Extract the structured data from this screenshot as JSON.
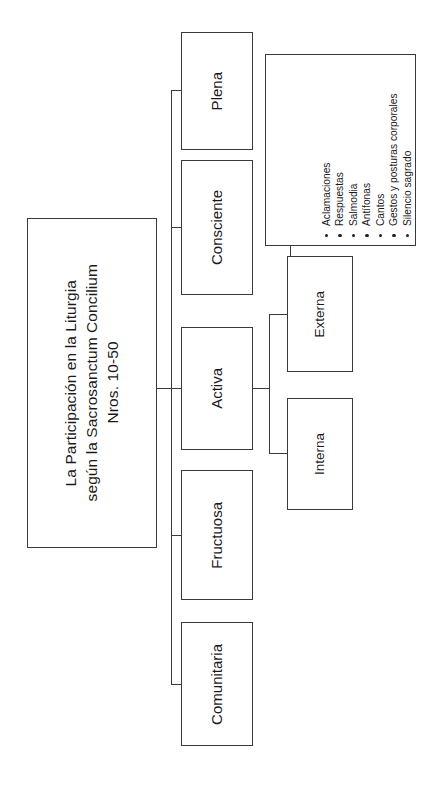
{
  "diagram": {
    "type": "tree",
    "orientation": "rotated-90-ccw",
    "root": {
      "title": "La Participación en la Liturgia según la Sacrosanctum Concilium Nros. 10-50",
      "line1": "La Participación en la Liturgia",
      "line2": "según la Sacrosanctum Concilium",
      "line3": "Nros. 10-50"
    },
    "level1": [
      {
        "label": "Plena"
      },
      {
        "label": "Consciente"
      },
      {
        "label": "Activa"
      },
      {
        "label": "Fructuosa"
      },
      {
        "label": "Comunitaria"
      }
    ],
    "level2": [
      {
        "label": "Externa",
        "parent": "Activa"
      },
      {
        "label": "Interna",
        "parent": "Activa"
      }
    ],
    "details": {
      "parent": "Externa",
      "items": [
        "Aclamaciones",
        "Respuestas",
        "Salmodia",
        "Antífonas",
        "Cantos",
        "Gestos y posturas corporales",
        "Silencio sagrado"
      ]
    },
    "colors": {
      "background": "#ffffff",
      "border": "#3a3a3a",
      "text": "#1a1a1a",
      "bullet": "#222222"
    }
  }
}
